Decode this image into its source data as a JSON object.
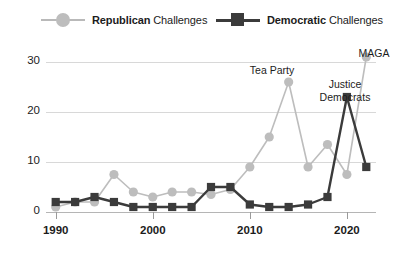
{
  "legend": {
    "items": [
      {
        "name": "republican",
        "bold": "Republican",
        "rest": " Challenges",
        "color": "#bdbdbd",
        "marker": "circle"
      },
      {
        "name": "democratic",
        "bold": "Democratic",
        "rest": " Challenges",
        "color": "#3b3b3b",
        "marker": "square"
      }
    ]
  },
  "axes": {
    "ylabel": "U.S. House Ideological Primary Challenges",
    "yticks": [
      "0",
      "10",
      "20",
      "30"
    ],
    "xticks": [
      "1990",
      "2000",
      "2010",
      "2020"
    ]
  },
  "annotations": [
    {
      "name": "tea-party",
      "text": "Tea Party",
      "lines": [
        "Tea Party"
      ],
      "x": 272,
      "y": 64
    },
    {
      "name": "justice-democrats",
      "text": "Justice Democrats",
      "lines": [
        "Justice",
        "Democrats"
      ],
      "x": 345,
      "y": 78
    },
    {
      "name": "maga",
      "text": "MAGA",
      "lines": [
        "MAGA"
      ],
      "x": 374,
      "y": 47
    }
  ],
  "chart_data": {
    "type": "line",
    "title": "",
    "xlabel": "",
    "ylabel": "U.S. House Ideological Primary Challenges",
    "xlim": [
      1989,
      2023
    ],
    "ylim": [
      0,
      32
    ],
    "grid": true,
    "legend_position": "top",
    "x": [
      1990,
      1992,
      1994,
      1996,
      1998,
      2000,
      2002,
      2004,
      2006,
      2008,
      2010,
      2012,
      2014,
      2016,
      2018,
      2020,
      2022
    ],
    "series": [
      {
        "name": "Republican Challenges",
        "color": "#bdbdbd",
        "marker": "circle",
        "values": [
          1,
          2,
          2,
          7.5,
          4,
          3,
          4,
          4,
          3.5,
          4.5,
          9,
          15,
          26,
          9,
          13.5,
          7.5,
          31
        ]
      },
      {
        "name": "Democratic Challenges",
        "color": "#3b3b3b",
        "marker": "square",
        "values": [
          2,
          2,
          3,
          2,
          1,
          1,
          1,
          1,
          5,
          5,
          1.5,
          1,
          1,
          1.5,
          3,
          23,
          9
        ]
      }
    ],
    "annotations": [
      {
        "label": "Tea Party",
        "series": "Republican Challenges",
        "x": 2014,
        "y": 26
      },
      {
        "label": "Justice Democrats",
        "series": "Democratic Challenges",
        "x": 2020,
        "y": 23
      },
      {
        "label": "MAGA",
        "series": "Republican Challenges",
        "x": 2022,
        "y": 31
      }
    ]
  }
}
